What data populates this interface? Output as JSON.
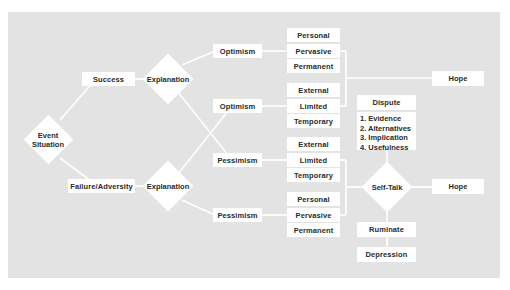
{
  "diagram": {
    "title": "",
    "start": {
      "label_line1": "Event",
      "label_line2": "Situation"
    },
    "branches": {
      "success": {
        "label": "Success",
        "decision": "Explanation",
        "optimism_a": "Optimism",
        "optimism_a_attrs": [
          "Personal",
          "Pervasive",
          "Permanent"
        ],
        "optimism_b": "Optimism",
        "optimism_b_attrs": [
          "External",
          "Limited",
          "Temporary"
        ],
        "outcome": "Hope"
      },
      "failure": {
        "label": "Failure/Adversity",
        "decision": "Explanation",
        "pessimism_a": "Pessimism",
        "pessimism_a_attrs": [
          "External",
          "Limited",
          "Temporary"
        ],
        "pessimism_b": "Pessimism",
        "pessimism_b_attrs": [
          "Personal",
          "Pervasive",
          "Permanent"
        ]
      }
    },
    "dispute": {
      "label": "Dispute",
      "steps": [
        "1. Evidence",
        "2. Alternatives",
        "3. Implication",
        "4. Usefulness"
      ]
    },
    "self_talk": {
      "label": "Self-Talk",
      "positive_outcome": "Hope",
      "negative_step": "Ruminate",
      "negative_outcome": "Depression"
    }
  },
  "colors": {
    "background": "#e3e3e3",
    "node_fill": "#ffffff",
    "line": "#ffffff",
    "text": "#2a2a2a"
  }
}
